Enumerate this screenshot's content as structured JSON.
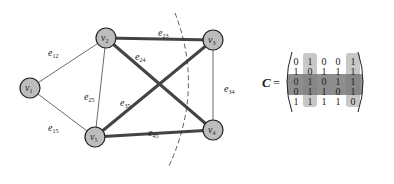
{
  "graph": {
    "nodes": [
      {
        "id": "v1",
        "label": "v",
        "sub": "1"
      },
      {
        "id": "v2",
        "label": "v",
        "sub": "2"
      },
      {
        "id": "v3",
        "label": "v",
        "sub": "3"
      },
      {
        "id": "v4",
        "label": "v",
        "sub": "4"
      },
      {
        "id": "v5",
        "label": "v",
        "sub": "5"
      }
    ],
    "edges": [
      {
        "id": "e12",
        "from": "v1",
        "to": "v2",
        "label": "e",
        "sub": "12",
        "weight": "thin"
      },
      {
        "id": "e15",
        "from": "v1",
        "to": "v5",
        "label": "e",
        "sub": "15",
        "weight": "thin"
      },
      {
        "id": "e25",
        "from": "v2",
        "to": "v5",
        "label": "e",
        "sub": "25",
        "weight": "thin"
      },
      {
        "id": "e23",
        "from": "v2",
        "to": "v3",
        "label": "e",
        "sub": "23",
        "weight": "thick"
      },
      {
        "id": "e24",
        "from": "v2",
        "to": "v4",
        "label": "e",
        "sub": "24",
        "weight": "thick"
      },
      {
        "id": "e35",
        "from": "v3",
        "to": "v5",
        "label": "e",
        "sub": "35",
        "weight": "thick"
      },
      {
        "id": "e45",
        "from": "v4",
        "to": "v5",
        "label": "e",
        "sub": "45",
        "weight": "thick"
      },
      {
        "id": "e34",
        "from": "v3",
        "to": "v4",
        "label": "e",
        "sub": "34",
        "weight": "thin"
      }
    ],
    "cut_line": "dashed"
  },
  "matrix": {
    "label": "C",
    "equals": "=",
    "rows": [
      [
        0,
        1,
        0,
        0,
        1
      ],
      [
        1,
        0,
        1,
        1,
        1
      ],
      [
        0,
        1,
        0,
        1,
        1
      ],
      [
        0,
        1,
        1,
        0,
        1
      ],
      [
        1,
        1,
        1,
        1,
        0
      ]
    ],
    "highlighted_columns": [
      2,
      5
    ],
    "highlighted_rows": [
      3,
      4
    ],
    "column_highlight_color": "#c8c8c8",
    "row_highlight_color": "#7a7a7a"
  }
}
